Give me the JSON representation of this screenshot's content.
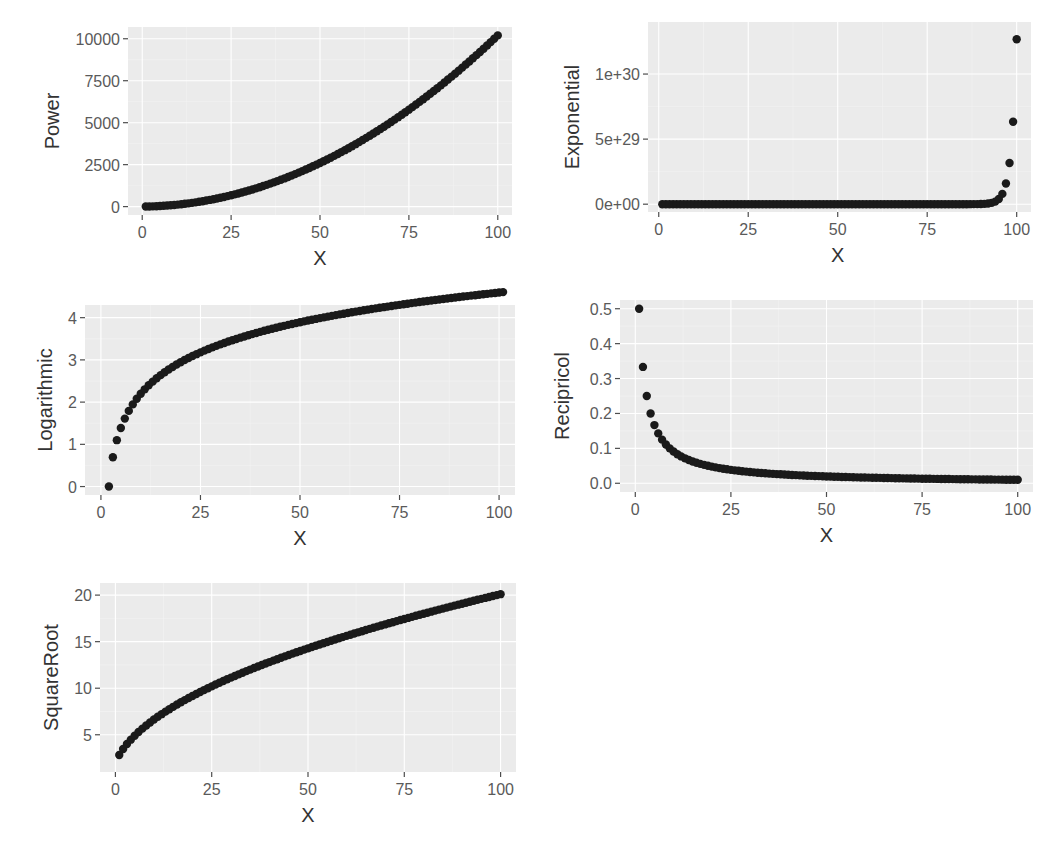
{
  "figure": {
    "background": "#ffffff",
    "panel_background": "#ebebeb",
    "point_color": "#1a1a1a"
  },
  "chart_data": [
    {
      "id": "power",
      "type": "scatter",
      "title": "",
      "xlabel": "X",
      "ylabel": "Power",
      "xlim": [
        -4,
        104
      ],
      "ylim": [
        -500,
        10700
      ],
      "x_ticks": [
        0,
        25,
        50,
        75,
        100
      ],
      "x_tick_labels": [
        "0",
        "25",
        "50",
        "75",
        "100"
      ],
      "y_ticks": [
        0,
        2500,
        5000,
        7500,
        10000
      ],
      "y_tick_labels": [
        "0",
        "2500",
        "5000",
        "7500",
        "10000"
      ],
      "grid": true,
      "formula": "y = x^2 + 2x",
      "x_range": [
        1,
        100
      ],
      "sample_points": [
        [
          1,
          3
        ],
        [
          10,
          120
        ],
        [
          25,
          675
        ],
        [
          50,
          2600
        ],
        [
          75,
          5775
        ],
        [
          100,
          10200
        ]
      ],
      "box": {
        "left": 128,
        "top": 27,
        "right": 512,
        "bottom": 215
      }
    },
    {
      "id": "exponential",
      "type": "scatter",
      "title": "",
      "xlabel": "X",
      "ylabel": "Exponential",
      "xlim": [
        -3,
        104
      ],
      "ylim": [
        -6e+28,
        1.4e+30
      ],
      "x_ticks": [
        0,
        25,
        50,
        75,
        100
      ],
      "x_tick_labels": [
        "0",
        "25",
        "50",
        "75",
        "100"
      ],
      "y_ticks": [
        0,
        5e+29,
        1e+30
      ],
      "y_tick_labels": [
        "0e+00",
        "5e+29",
        "1e+30"
      ],
      "grid": true,
      "formula": "y = 2^x",
      "x_range": [
        1,
        100
      ],
      "sample_points": [
        [
          1,
          2
        ],
        [
          50,
          1130000000000000.0
        ],
        [
          96,
          7.9e+28
        ],
        [
          97,
          1.58e+29
        ],
        [
          98,
          3.17e+29
        ],
        [
          99,
          6.34e+29
        ],
        [
          100,
          1.27e+30
        ]
      ],
      "box": {
        "left": 648,
        "top": 22,
        "right": 1031,
        "bottom": 212
      }
    },
    {
      "id": "logarithmic",
      "type": "scatter",
      "title": "",
      "xlabel": "X",
      "ylabel": "Logarithmic",
      "xlim": [
        -4,
        104
      ],
      "ylim": [
        -0.2,
        4.3
      ],
      "x_ticks": [
        0,
        25,
        50,
        75,
        100
      ],
      "x_tick_labels": [
        "0",
        "25",
        "50",
        "75",
        "100"
      ],
      "y_ticks": [
        0,
        1,
        2,
        3,
        4
      ],
      "y_tick_labels": [
        "0",
        "1",
        "2",
        "3",
        "4"
      ],
      "grid": true,
      "formula": "y = ln(x - 1)",
      "x_range": [
        2,
        101
      ],
      "sample_points": [
        [
          2,
          0
        ],
        [
          3,
          0.69
        ],
        [
          4,
          1.1
        ],
        [
          11,
          2.3
        ],
        [
          26,
          3.22
        ],
        [
          51,
          3.91
        ],
        [
          101,
          4.61
        ]
      ],
      "box": {
        "left": 85,
        "top": 305,
        "right": 515,
        "bottom": 495
      }
    },
    {
      "id": "reciprocal",
      "type": "scatter",
      "title": "",
      "xlabel": "X",
      "ylabel": "Recipricol",
      "xlim": [
        -4,
        104
      ],
      "ylim": [
        -0.025,
        0.525
      ],
      "x_ticks": [
        0,
        25,
        50,
        75,
        100
      ],
      "x_tick_labels": [
        "0",
        "25",
        "50",
        "75",
        "100"
      ],
      "y_ticks": [
        0.0,
        0.1,
        0.2,
        0.3,
        0.4,
        0.5
      ],
      "y_tick_labels": [
        "0.0",
        "0.1",
        "0.2",
        "0.3",
        "0.4",
        "0.5"
      ],
      "grid": true,
      "formula": "y = 1 / (x + 1)",
      "x_range": [
        1,
        100
      ],
      "sample_points": [
        [
          1,
          0.5
        ],
        [
          2,
          0.333
        ],
        [
          3,
          0.25
        ],
        [
          5,
          0.167
        ],
        [
          10,
          0.091
        ],
        [
          25,
          0.038
        ],
        [
          50,
          0.02
        ],
        [
          100,
          0.0099
        ]
      ],
      "box": {
        "left": 620,
        "top": 300,
        "right": 1033,
        "bottom": 492
      }
    },
    {
      "id": "squareroot",
      "type": "scatter",
      "title": "",
      "xlabel": "X",
      "ylabel": "SquareRoot",
      "xlim": [
        -4,
        104
      ],
      "ylim": [
        1,
        21.3
      ],
      "x_ticks": [
        0,
        25,
        50,
        75,
        100
      ],
      "x_tick_labels": [
        "0",
        "25",
        "50",
        "75",
        "100"
      ],
      "y_ticks": [
        5,
        10,
        15,
        20
      ],
      "y_tick_labels": [
        "5",
        "10",
        "15",
        "20"
      ],
      "grid": true,
      "formula": "y = 2 * sqrt(x + 1)",
      "x_range": [
        1,
        100
      ],
      "sample_points": [
        [
          1,
          2.0
        ],
        [
          10,
          6.6
        ],
        [
          25,
          10.2
        ],
        [
          50,
          14.3
        ],
        [
          75,
          17.4
        ],
        [
          100,
          20.1
        ]
      ],
      "box": {
        "left": 100,
        "top": 583,
        "right": 516,
        "bottom": 772
      }
    }
  ]
}
